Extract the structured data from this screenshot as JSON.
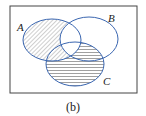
{
  "diagram": {
    "type": "venn",
    "sets": [
      {
        "label": "A",
        "cx": 52,
        "cy": 40,
        "rx": 29,
        "ry": 21
      },
      {
        "label": "B",
        "cx": 89,
        "cy": 39,
        "rx": 29,
        "ry": 22
      },
      {
        "label": "C",
        "cx": 75,
        "cy": 64,
        "rx": 29,
        "ry": 22
      }
    ],
    "shaded_regions": [
      {
        "region": "A minus B",
        "pattern": "diagonal"
      },
      {
        "region": "C minus (A union B) and (B intersect C minus A)",
        "pattern": "horizontal"
      }
    ],
    "caption": "(b)",
    "colors": {
      "outline": "#3a66b0",
      "frame": "#444444",
      "hatch": "#888888"
    }
  }
}
